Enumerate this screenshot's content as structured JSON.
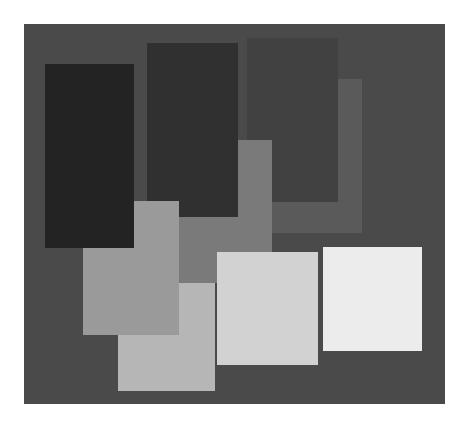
{
  "canvas": {
    "width": 473,
    "height": 424,
    "background": "#ffffff"
  },
  "frame": {
    "x": 24,
    "y": 24,
    "w": 421,
    "h": 380,
    "color": "#4a4a4a"
  },
  "rects": [
    {
      "id": "rect-d-mid-dark-gray",
      "x": 250,
      "y": 79,
      "w": 112,
      "h": 154,
      "color": "#5a5a5a",
      "z": 1
    },
    {
      "id": "rect-c-charcoal",
      "x": 247,
      "y": 38,
      "w": 91,
      "h": 164,
      "color": "#414141",
      "z": 2
    },
    {
      "id": "rect-e-medium-gray",
      "x": 177,
      "y": 140,
      "w": 95,
      "h": 143,
      "color": "#7a7a7a",
      "z": 3
    },
    {
      "id": "rect-b-dark",
      "x": 147,
      "y": 43,
      "w": 91,
      "h": 174,
      "color": "#303030",
      "z": 4
    },
    {
      "id": "rect-i-gray",
      "x": 83,
      "y": 201,
      "w": 96,
      "h": 134,
      "color": "#9a9a9a",
      "z": 5
    },
    {
      "id": "rect-a-darkest",
      "x": 45,
      "y": 64,
      "w": 89,
      "h": 184,
      "color": "#232323",
      "z": 6
    },
    {
      "id": "rect-f-light-gray",
      "x": 118,
      "y": 283,
      "w": 97,
      "h": 108,
      "color": "#b6b6b6",
      "z": 4
    },
    {
      "id": "rect-g-lighter-gray",
      "x": 217,
      "y": 252,
      "w": 101,
      "h": 113,
      "color": "#d2d2d2",
      "z": 7
    },
    {
      "id": "rect-h-near-white",
      "x": 323,
      "y": 247,
      "w": 99,
      "h": 104,
      "color": "#ececec",
      "z": 7
    }
  ]
}
